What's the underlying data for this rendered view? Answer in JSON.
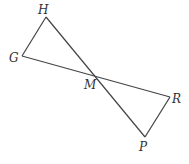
{
  "diagram": {
    "type": "geometry",
    "colors": {
      "line": "#444444",
      "label": "#333333",
      "background": "#ffffff"
    },
    "points": {
      "H": {
        "label": "H",
        "x": 46,
        "y": 17
      },
      "G": {
        "label": "G",
        "x": 22,
        "y": 56
      },
      "M": {
        "label": "M",
        "x": 95,
        "y": 77
      },
      "R": {
        "label": "R",
        "x": 170,
        "y": 97
      },
      "P": {
        "label": "P",
        "x": 145,
        "y": 137
      }
    },
    "segments": [
      {
        "name": "GH",
        "from": "G",
        "to": "H"
      },
      {
        "name": "HP",
        "from": "H",
        "to": "P"
      },
      {
        "name": "GR",
        "from": "G",
        "to": "R"
      },
      {
        "name": "RP",
        "from": "R",
        "to": "P"
      }
    ]
  }
}
